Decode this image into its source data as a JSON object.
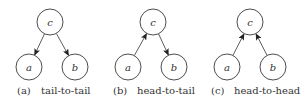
{
  "panels": [
    {
      "id": "a",
      "tag": "(a)",
      "caption": "tail-to-tail",
      "nodes": [
        {
          "name": "c",
          "label": "c",
          "x": 50,
          "y": 22
        },
        {
          "name": "a",
          "label": "a",
          "x": 29,
          "y": 67
        },
        {
          "name": "b",
          "label": "b",
          "x": 75,
          "y": 67
        }
      ],
      "edges": [
        {
          "from": "c",
          "to": "a"
        },
        {
          "from": "c",
          "to": "b"
        }
      ]
    },
    {
      "id": "b",
      "tag": "(b)",
      "caption": "head-to-tail",
      "nodes": [
        {
          "name": "c",
          "label": "c",
          "x": 153,
          "y": 22
        },
        {
          "name": "a",
          "label": "a",
          "x": 128,
          "y": 67
        },
        {
          "name": "b",
          "label": "b",
          "x": 174,
          "y": 67
        }
      ],
      "edges": [
        {
          "from": "a",
          "to": "c"
        },
        {
          "from": "c",
          "to": "b"
        }
      ]
    },
    {
      "id": "c",
      "tag": "(c)",
      "caption": "head-to-head",
      "nodes": [
        {
          "name": "c",
          "label": "c",
          "x": 250,
          "y": 22
        },
        {
          "name": "a",
          "label": "a",
          "x": 227,
          "y": 67
        },
        {
          "name": "b",
          "label": "b",
          "x": 273,
          "y": 67
        }
      ],
      "edges": [
        {
          "from": "a",
          "to": "c"
        },
        {
          "from": "b",
          "to": "c"
        }
      ]
    }
  ],
  "style": {
    "node_radius": 13,
    "stroke_color": "#333333"
  }
}
